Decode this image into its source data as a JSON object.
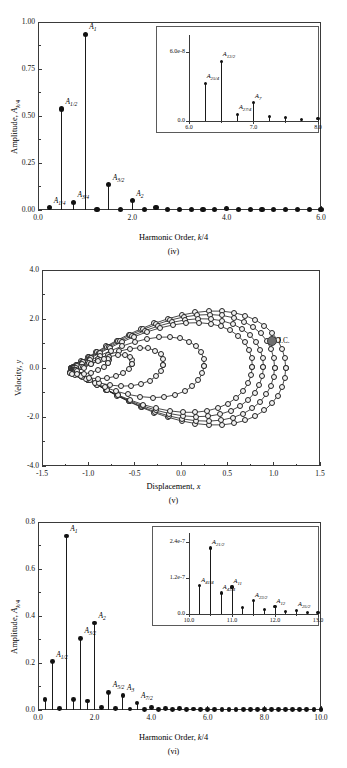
{
  "figure": {
    "panels": [
      "(iv)",
      "(v)",
      "(vi)"
    ]
  },
  "chart_data": [
    {
      "type": "bar",
      "panel": "(iv)",
      "title": "",
      "xlabel": "Harmonic Order, k/4",
      "ylabel": "Amplitude, A_k/4",
      "xlim": [
        0.0,
        6.0
      ],
      "ylim": [
        0.0,
        1.0
      ],
      "xticks": [
        "0.0",
        "2.0",
        "4.0",
        "6.0"
      ],
      "yticks": [
        "0.00",
        "0.25",
        "0.50",
        "0.75",
        "1.00"
      ],
      "grid": false,
      "x": [
        0.25,
        0.5,
        0.75,
        1.0,
        1.25,
        1.5,
        1.75,
        2.0,
        2.25,
        2.5,
        2.75,
        3.0,
        3.25,
        3.5,
        3.75,
        4.0,
        4.25,
        4.5,
        4.75,
        5.0,
        5.25,
        5.5,
        5.75,
        6.0
      ],
      "values": [
        0.012,
        0.537,
        0.04,
        0.935,
        0.004,
        0.135,
        0.004,
        0.05,
        0.003,
        0.012,
        0.002,
        0.003,
        0.002,
        0.002,
        0.001,
        0.006,
        0.001,
        0.001,
        0.001,
        0.001,
        0.001,
        0.001,
        0.001,
        0.001
      ],
      "annotations": [
        {
          "label": "A",
          "sub": "1/4",
          "x": 0.25,
          "y": 0.012
        },
        {
          "label": "A",
          "sub": "1/2",
          "x": 0.5,
          "y": 0.537
        },
        {
          "label": "A",
          "sub": "3/4",
          "x": 0.75,
          "y": 0.04
        },
        {
          "label": "A",
          "sub": "1",
          "x": 1.0,
          "y": 0.935
        },
        {
          "label": "A",
          "sub": "3/2",
          "x": 1.5,
          "y": 0.135
        },
        {
          "label": "A",
          "sub": "2",
          "x": 2.0,
          "y": 0.05
        }
      ],
      "inset": {
        "xlim": [
          6.0,
          8.0
        ],
        "ylim": [
          0.0,
          7.5e-08
        ],
        "xticks": [
          "6.0",
          "7.0",
          "8.0"
        ],
        "yticks": [
          "0.0",
          "6.0e-8"
        ],
        "x": [
          6.25,
          6.5,
          6.75,
          7.0,
          7.25,
          7.5,
          7.75,
          8.0
        ],
        "values": [
          3.3e-08,
          5.2e-08,
          6e-09,
          1.6e-08,
          4e-09,
          3e-09,
          1.5e-09,
          2e-09
        ],
        "annotations": [
          {
            "label": "A",
            "sub": "25/4",
            "x": 6.25
          },
          {
            "label": "A",
            "sub": "13/2",
            "x": 6.5
          },
          {
            "label": "A",
            "sub": "27/4",
            "x": 6.75
          },
          {
            "label": "A",
            "sub": "7",
            "x": 7.0
          }
        ]
      }
    },
    {
      "type": "scatter",
      "panel": "(v)",
      "title": "",
      "xlabel": "Displacement, x",
      "ylabel": "Velocity, y",
      "xlim": [
        -1.5,
        1.5
      ],
      "ylim": [
        -4.0,
        4.0
      ],
      "xticks": [
        "-1.5",
        "-1.0",
        "-0.5",
        "0.0",
        "0.5",
        "1.0",
        "1.5"
      ],
      "yticks": [
        "-4.0",
        "-2.0",
        "0.0",
        "2.0",
        "4.0"
      ],
      "grid": false,
      "marker": "open-circle",
      "initial_condition": {
        "label": "I.C.",
        "x": 0.98,
        "y": 1.1
      }
    },
    {
      "type": "bar",
      "panel": "(vi)",
      "title": "",
      "xlabel": "Harmonic Order, k/4",
      "ylabel": "Amplitude, A_k/4",
      "xlim": [
        0.0,
        10.0
      ],
      "ylim": [
        0.0,
        0.8
      ],
      "xticks": [
        "0.0",
        "2.0",
        "4.0",
        "6.0",
        "8.0",
        "10.0"
      ],
      "yticks": [
        "0.0",
        "0.2",
        "0.4",
        "0.6",
        "0.8"
      ],
      "grid": false,
      "x": [
        0.25,
        0.5,
        0.75,
        1.0,
        1.25,
        1.5,
        1.75,
        2.0,
        2.25,
        2.5,
        2.75,
        3.0,
        3.25,
        3.5,
        3.75,
        4.0,
        4.25,
        4.5,
        4.75,
        5.0,
        5.25,
        5.5,
        5.75,
        6.0,
        6.25,
        6.5,
        6.75,
        7.0,
        7.25,
        7.5,
        7.75,
        8.0,
        8.25,
        8.5,
        8.75,
        9.0,
        9.25,
        9.5,
        9.75,
        10.0
      ],
      "values": [
        0.045,
        0.205,
        0.008,
        0.74,
        0.046,
        0.305,
        0.038,
        0.37,
        0.012,
        0.075,
        0.006,
        0.063,
        0.004,
        0.03,
        0.003,
        0.012,
        0.002,
        0.006,
        0.002,
        0.005,
        0.002,
        0.004,
        0.002,
        0.003,
        0.002,
        0.003,
        0.002,
        0.002,
        0.002,
        0.002,
        0.002,
        0.002,
        0.002,
        0.002,
        0.002,
        0.002,
        0.002,
        0.002,
        0.002,
        0.002
      ],
      "annotations": [
        {
          "label": "A",
          "sub": "1/2",
          "x": 0.5,
          "y": 0.205
        },
        {
          "label": "A",
          "sub": "1",
          "x": 1.0,
          "y": 0.74
        },
        {
          "label": "A",
          "sub": "3/2",
          "x": 1.5,
          "y": 0.305
        },
        {
          "label": "A",
          "sub": "2",
          "x": 2.0,
          "y": 0.37
        },
        {
          "label": "A",
          "sub": "5/2",
          "x": 2.5,
          "y": 0.075
        },
        {
          "label": "A",
          "sub": "3",
          "x": 3.0,
          "y": 0.063
        },
        {
          "label": "A",
          "sub": "7/2",
          "x": 3.5,
          "y": 0.03
        }
      ],
      "inset": {
        "xlim": [
          10.0,
          13.0
        ],
        "ylim": [
          0.0,
          2.7e-07
        ],
        "xticks": [
          "10.0",
          "11.0",
          "12.0",
          "13.0"
        ],
        "yticks": [
          "0.0",
          "1.2e-7",
          "2.4e-7"
        ],
        "x": [
          10.25,
          10.5,
          10.75,
          11.0,
          11.25,
          11.5,
          11.75,
          12.0,
          12.25,
          12.5,
          12.75,
          13.0
        ],
        "values": [
          9.5e-08,
          2.2e-07,
          7e-08,
          9e-08,
          2.2e-08,
          4.5e-08,
          1.5e-08,
          2.5e-08,
          7e-09,
          1.2e-08,
          5e-09,
          6e-09
        ],
        "annotations": [
          {
            "label": "A",
            "sub": "41/4",
            "x": 10.25
          },
          {
            "label": "A",
            "sub": "21/2",
            "x": 10.5
          },
          {
            "label": "A",
            "sub": "43/4",
            "x": 10.75
          },
          {
            "label": "A",
            "sub": "11",
            "x": 11.0
          },
          {
            "label": "A",
            "sub": "23/2",
            "x": 11.5
          },
          {
            "label": "A",
            "sub": "12",
            "x": 12.0
          },
          {
            "label": "A",
            "sub": "25/2",
            "x": 12.5
          }
        ]
      }
    }
  ]
}
